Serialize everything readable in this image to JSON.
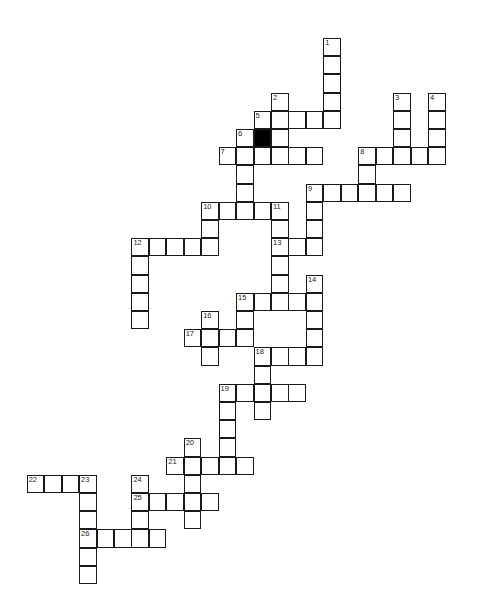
{
  "puzzle": {
    "layout": {
      "origin_x": 26.7,
      "origin_y": 38,
      "step_x": 17.45,
      "step_y": 18.2
    },
    "colors": {
      "cell_fill": "#ffffff",
      "cell_border": "#1a1a1a",
      "blocked": "#000000"
    },
    "blocked_cells": [
      {
        "col": 13,
        "row": 5
      }
    ],
    "across": [
      {
        "number": "5",
        "col": 13,
        "row": 4,
        "length": 5
      },
      {
        "number": "7",
        "col": 11,
        "row": 6,
        "length": 6
      },
      {
        "number": "8",
        "col": 19,
        "row": 6,
        "length": 5
      },
      {
        "number": "9",
        "col": 16,
        "row": 8,
        "length": 6
      },
      {
        "number": "10",
        "col": 10,
        "row": 9,
        "length": 5
      },
      {
        "number": "12",
        "col": 6,
        "row": 11,
        "length": 5
      },
      {
        "number": "13",
        "col": 14,
        "row": 11,
        "length": 3
      },
      {
        "number": "15",
        "col": 12,
        "row": 14,
        "length": 5
      },
      {
        "number": "17",
        "col": 9,
        "row": 16,
        "length": 4
      },
      {
        "number": "18",
        "col": 13,
        "row": 17,
        "length": 4
      },
      {
        "number": "19",
        "col": 11,
        "row": 19,
        "length": 5
      },
      {
        "number": "21",
        "col": 8,
        "row": 23,
        "length": 5
      },
      {
        "number": "22",
        "col": 0,
        "row": 24,
        "length": 4
      },
      {
        "number": "25",
        "col": 6,
        "row": 25,
        "length": 5
      },
      {
        "number": "26",
        "col": 3,
        "row": 27,
        "length": 5
      }
    ],
    "down": [
      {
        "number": "1",
        "col": 17,
        "row": 0,
        "length": 5
      },
      {
        "number": "2",
        "col": 14,
        "row": 3,
        "length": 4
      },
      {
        "number": "3",
        "col": 21,
        "row": 3,
        "length": 4
      },
      {
        "number": "4",
        "col": 23,
        "row": 3,
        "length": 4
      },
      {
        "number": "6",
        "col": 12,
        "row": 5,
        "length": 5
      },
      {
        "number": "8",
        "col": 19,
        "row": 6,
        "length": 3
      },
      {
        "number": "9",
        "col": 16,
        "row": 8,
        "length": 4
      },
      {
        "number": "10",
        "col": 10,
        "row": 9,
        "length": 3
      },
      {
        "number": "11",
        "col": 14,
        "row": 9,
        "length": 6
      },
      {
        "number": "12",
        "col": 6,
        "row": 11,
        "length": 5
      },
      {
        "number": "14",
        "col": 16,
        "row": 13,
        "length": 5
      },
      {
        "number": "15",
        "col": 12,
        "row": 14,
        "length": 3
      },
      {
        "number": "16",
        "col": 10,
        "row": 15,
        "length": 3
      },
      {
        "number": "18",
        "col": 13,
        "row": 17,
        "length": 4
      },
      {
        "number": "19",
        "col": 11,
        "row": 19,
        "length": 5
      },
      {
        "number": "20",
        "col": 9,
        "row": 22,
        "length": 5
      },
      {
        "number": "23",
        "col": 3,
        "row": 24,
        "length": 6
      },
      {
        "number": "24",
        "col": 6,
        "row": 24,
        "length": 4
      }
    ]
  }
}
